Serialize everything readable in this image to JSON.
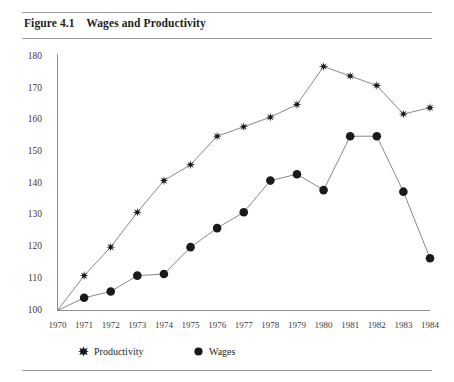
{
  "figure": {
    "title": "Figure 4.1    Wages and Productivity"
  },
  "legend": {
    "items": [
      {
        "label": "Productivity",
        "marker": "diamond-star-marker",
        "color": "#1a1a1a"
      },
      {
        "label": "Wages",
        "marker": "filled-circle-marker",
        "color": "#1a1a1a"
      }
    ]
  },
  "axes": {
    "y_ticks": [
      "180",
      "170",
      "160",
      "150",
      "140",
      "130",
      "120",
      "110",
      "100"
    ],
    "x_ticks": [
      "1970",
      "1971",
      "1972",
      "1973",
      "1974",
      "1975",
      "1976",
      "1977",
      "1978",
      "1979",
      "1980",
      "1981",
      "1982",
      "1983",
      "1984"
    ]
  },
  "chart_data": {
    "type": "line",
    "title": "Figure 4.1    Wages and Productivity",
    "xlabel": "",
    "ylabel": "",
    "x": [
      1970,
      1971,
      1972,
      1973,
      1974,
      1975,
      1976,
      1977,
      1978,
      1979,
      1980,
      1981,
      1982,
      1983,
      1984
    ],
    "xlim": [
      1970,
      1984
    ],
    "ylim": [
      100,
      180
    ],
    "ytick_step": 10,
    "grid": false,
    "legend_position": "bottom",
    "series": [
      {
        "name": "Productivity",
        "marker": "diamond-star",
        "color": "#1a1a1a",
        "values": [
          100,
          111,
          120,
          131,
          141,
          146,
          155,
          158,
          161,
          165,
          177,
          174,
          171,
          162,
          164
        ]
      },
      {
        "name": "Wages",
        "marker": "filled-circle",
        "color": "#1a1a1a",
        "values": [
          100,
          104,
          106,
          111,
          111.5,
          120,
          126,
          131,
          141,
          143,
          138,
          155,
          155,
          137.5,
          116.5
        ]
      }
    ]
  }
}
